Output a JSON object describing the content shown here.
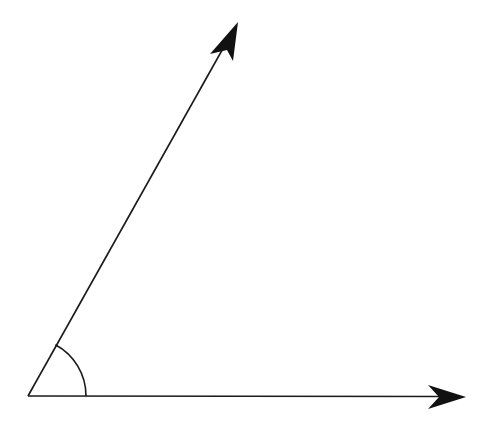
{
  "diagram": {
    "type": "angle",
    "vertex": {
      "x": 28,
      "y": 396
    },
    "rays": [
      {
        "name": "upper-ray",
        "end": {
          "x": 238,
          "y": 22
        }
      },
      {
        "name": "horizontal-ray",
        "end": {
          "x": 466,
          "y": 397
        }
      }
    ],
    "arc_radius": 58,
    "stroke_color": "#1a1a1a",
    "background": "#ffffff"
  }
}
